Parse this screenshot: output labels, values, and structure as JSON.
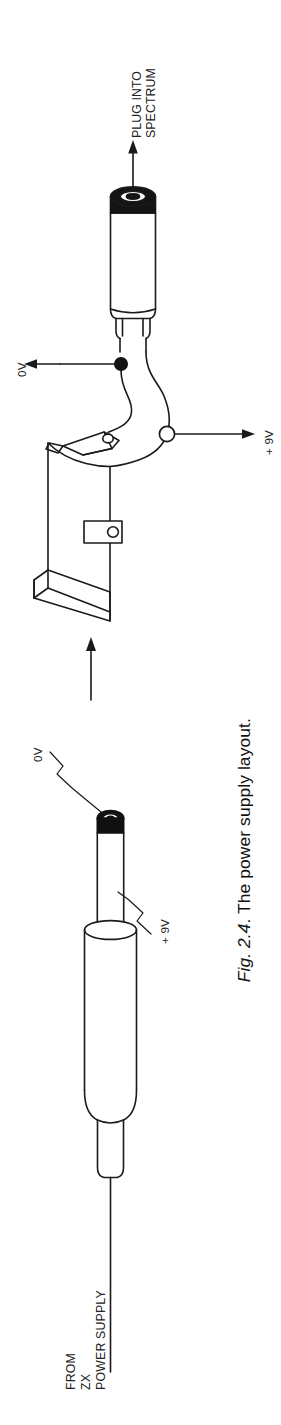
{
  "figure": {
    "caption_number": "Fig. 2.4",
    "caption_text": ". The power supply layout.",
    "orientation": "rotated-90-ccw"
  },
  "labels": {
    "plug_into_spectrum": "PLUG INTO\nSPECTRUM",
    "zero_volt_terminal": "0V",
    "nine_volt_terminal": "+ 9V",
    "zero_volt_plug_lead": "0V",
    "nine_volt_plug_lead": "+ 9V",
    "source": "FROM\nZX\nPOWER SUPPLY"
  },
  "components": {
    "jack_plug": "jack-plug",
    "battery": "pp3-9v-battery",
    "battery_snap_connector": "battery-snap-connector",
    "dc_plug": "dc-power-plug",
    "cable": "power-cable"
  },
  "colors": {
    "ink": "#1a1a1a",
    "paper": "#ffffff",
    "fill": "#ffffff",
    "dark_band": "#101010"
  }
}
